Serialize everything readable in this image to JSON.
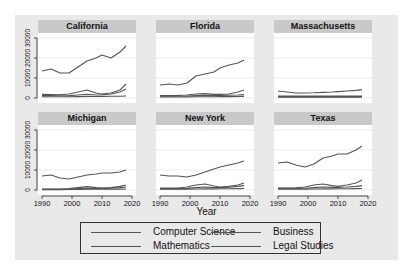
{
  "chart_data": {
    "type": "line",
    "xlabel": "Year",
    "ylabel": "",
    "ylim": [
      0,
      30000
    ],
    "xlim": [
      1990,
      2020
    ],
    "x_ticks": [
      1990,
      2000,
      2010,
      2020
    ],
    "y_ticks": [
      0,
      10000,
      20000,
      30000
    ],
    "grid": true,
    "legend_position": "bottom",
    "legend": [
      "Computer Science",
      "Business",
      "Mathematics",
      "Legal Studies"
    ],
    "x": [
      1990,
      1993,
      1996,
      1999,
      2002,
      2005,
      2008,
      2010,
      2013,
      2016,
      2018
    ],
    "panels": [
      {
        "title": "California",
        "series": [
          {
            "name": "Computer Science",
            "values": [
              13500,
              14500,
              12500,
              12500,
              15500,
              18500,
              20000,
              21500,
              20000,
              23000,
              26000
            ]
          },
          {
            "name": "Business",
            "values": [
              1800,
              1700,
              1600,
              2000,
              3000,
              4000,
              2500,
              2000,
              2500,
              4000,
              7000
            ]
          },
          {
            "name": "Mathematics",
            "values": [
              1200,
              1200,
              1100,
              1200,
              1500,
              1800,
              1500,
              1600,
              2000,
              3000,
              4500
            ]
          },
          {
            "name": "Legal Studies",
            "values": [
              600,
              600,
              600,
              650,
              700,
              750,
              750,
              800,
              850,
              900,
              1000
            ]
          }
        ]
      },
      {
        "title": "Florida",
        "series": [
          {
            "name": "Computer Science",
            "values": [
              6500,
              7000,
              6500,
              7500,
              11000,
              12000,
              13000,
              15000,
              16500,
              17500,
              19000
            ]
          },
          {
            "name": "Business",
            "values": [
              1200,
              1200,
              1300,
              1500,
              2000,
              2200,
              1800,
              1800,
              2000,
              3000,
              4000
            ]
          },
          {
            "name": "Mathematics",
            "values": [
              900,
              900,
              900,
              1000,
              1200,
              1300,
              1200,
              1300,
              1400,
              1500,
              1700
            ]
          },
          {
            "name": "Legal Studies",
            "values": [
              500,
              500,
              500,
              550,
              600,
              650,
              650,
              700,
              700,
              750,
              800
            ]
          }
        ]
      },
      {
        "title": "Massachusetts",
        "series": [
          {
            "name": "Computer Science",
            "values": [
              3500,
              3000,
              2500,
              2500,
              2600,
              2800,
              3000,
              3200,
              3500,
              3800,
              4200
            ]
          },
          {
            "name": "Business",
            "values": [
              1000,
              1000,
              1000,
              1000,
              1000,
              1000,
              1000,
              1000,
              1000,
              1000,
              1000
            ]
          },
          {
            "name": "Mathematics",
            "values": [
              700,
              700,
              700,
              700,
              700,
              700,
              700,
              700,
              700,
              700,
              700
            ]
          },
          {
            "name": "Legal Studies",
            "values": [
              400,
              400,
              400,
              400,
              400,
              400,
              400,
              400,
              400,
              400,
              400
            ]
          }
        ]
      },
      {
        "title": "Michigan",
        "series": [
          {
            "name": "Computer Science",
            "values": [
              7000,
              7500,
              6000,
              5500,
              6500,
              7500,
              8000,
              8500,
              8500,
              9000,
              10000
            ]
          },
          {
            "name": "Business",
            "values": [
              500,
              500,
              500,
              700,
              1200,
              1700,
              1200,
              1000,
              1200,
              1800,
              2500
            ]
          },
          {
            "name": "Mathematics",
            "values": [
              400,
              400,
              400,
              500,
              700,
              900,
              800,
              800,
              900,
              1200,
              1500
            ]
          },
          {
            "name": "Legal Studies",
            "values": [
              200,
              200,
              200,
              250,
              300,
              350,
              350,
              400,
              400,
              450,
              500
            ]
          }
        ]
      },
      {
        "title": "New York",
        "series": [
          {
            "name": "Computer Science",
            "values": [
              7500,
              7000,
              7000,
              6500,
              7500,
              9000,
              10500,
              11500,
              12500,
              13500,
              14500
            ]
          },
          {
            "name": "Business",
            "values": [
              1000,
              1000,
              1000,
              1500,
              2500,
              3000,
              2000,
              1500,
              1800,
              2500,
              3500
            ]
          },
          {
            "name": "Mathematics",
            "values": [
              700,
              700,
              700,
              800,
              1200,
              1500,
              1200,
              1200,
              1400,
              1800,
              2200
            ]
          },
          {
            "name": "Legal Studies",
            "values": [
              400,
              400,
              400,
              450,
              500,
              550,
              550,
              600,
              650,
              700,
              750
            ]
          }
        ]
      },
      {
        "title": "Texas",
        "series": [
          {
            "name": "Computer Science",
            "values": [
              13500,
              14000,
              12500,
              11500,
              13000,
              16000,
              17000,
              18000,
              18000,
              20000,
              22000
            ]
          },
          {
            "name": "Business",
            "values": [
              1000,
              1000,
              1100,
              1500,
              2500,
              3000,
              2200,
              1800,
              2500,
              3500,
              5000
            ]
          },
          {
            "name": "Mathematics",
            "values": [
              800,
              800,
              800,
              900,
              1200,
              1500,
              1300,
              1300,
              1500,
              1800,
              2200
            ]
          },
          {
            "name": "Legal Studies",
            "values": [
              400,
              400,
              400,
              450,
              500,
              550,
              550,
              600,
              650,
              700,
              750
            ]
          }
        ]
      }
    ]
  },
  "axes": {
    "y_tick_labels": [
      "0",
      "10000",
      "20000",
      "30000"
    ],
    "x_tick_labels": [
      "1990",
      "2000",
      "2010",
      "2020"
    ],
    "x_title": "Year"
  },
  "legend": {
    "items": [
      {
        "label": "Computer Science"
      },
      {
        "label": "Business"
      },
      {
        "label": "Mathematics"
      },
      {
        "label": "Legal Studies"
      }
    ]
  },
  "colors": {
    "figure_bg": "#e9e9e9",
    "strip_bg": "#c9c9c9",
    "plot_bg": "#ffffff",
    "gridline": "#e6e6e6",
    "line": "#555555"
  }
}
